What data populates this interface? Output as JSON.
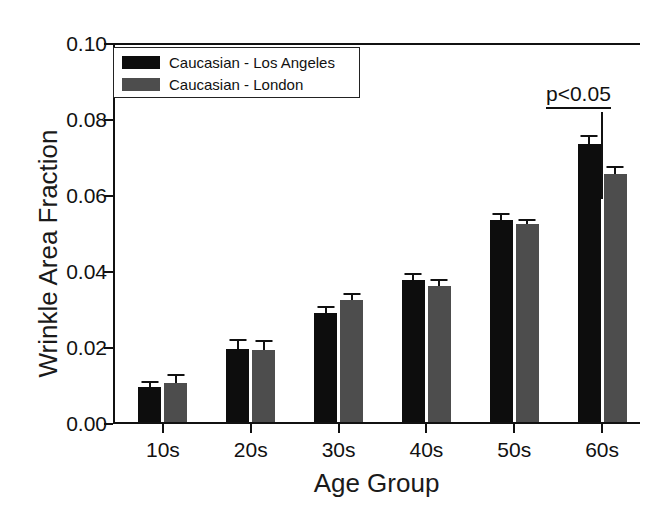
{
  "chart_data": {
    "type": "bar",
    "title": "",
    "xlabel": "Age Group",
    "ylabel": "Wrinkle Area Fraction",
    "categories": [
      "10s",
      "20s",
      "30s",
      "40s",
      "50s",
      "60s"
    ],
    "ylim": [
      0.0,
      0.1
    ],
    "ytick_labels": [
      "0.00",
      "0.02",
      "0.04",
      "0.06",
      "0.08",
      "0.10"
    ],
    "ytick_values": [
      0.0,
      0.02,
      0.04,
      0.06,
      0.08,
      0.1
    ],
    "grid": false,
    "legend_position": "top-left",
    "series": [
      {
        "name": "Caucasian - Los Angeles",
        "color": "#0d0d0d",
        "values": [
          0.0092,
          0.0192,
          0.0286,
          0.0374,
          0.0532,
          0.0732
        ],
        "errors": [
          0.0016,
          0.0026,
          0.002,
          0.0018,
          0.0017,
          0.0024
        ]
      },
      {
        "name": "Caucasian - London",
        "color": "#4d4d4d",
        "values": [
          0.0103,
          0.019,
          0.032,
          0.0358,
          0.052,
          0.0653
        ],
        "errors": [
          0.0024,
          0.0026,
          0.002,
          0.0018,
          0.0015,
          0.0022
        ]
      }
    ],
    "annotations": [
      {
        "text": "p<0.05",
        "underline": true,
        "marker": "vertical-bar"
      }
    ]
  },
  "legend": {
    "items": [
      {
        "label": "Caucasian - Los Angeles",
        "color": "#0d0d0d"
      },
      {
        "label": "Caucasian - London",
        "color": "#4d4d4d"
      }
    ]
  },
  "annotation": {
    "significance_label": "p<0.05"
  }
}
